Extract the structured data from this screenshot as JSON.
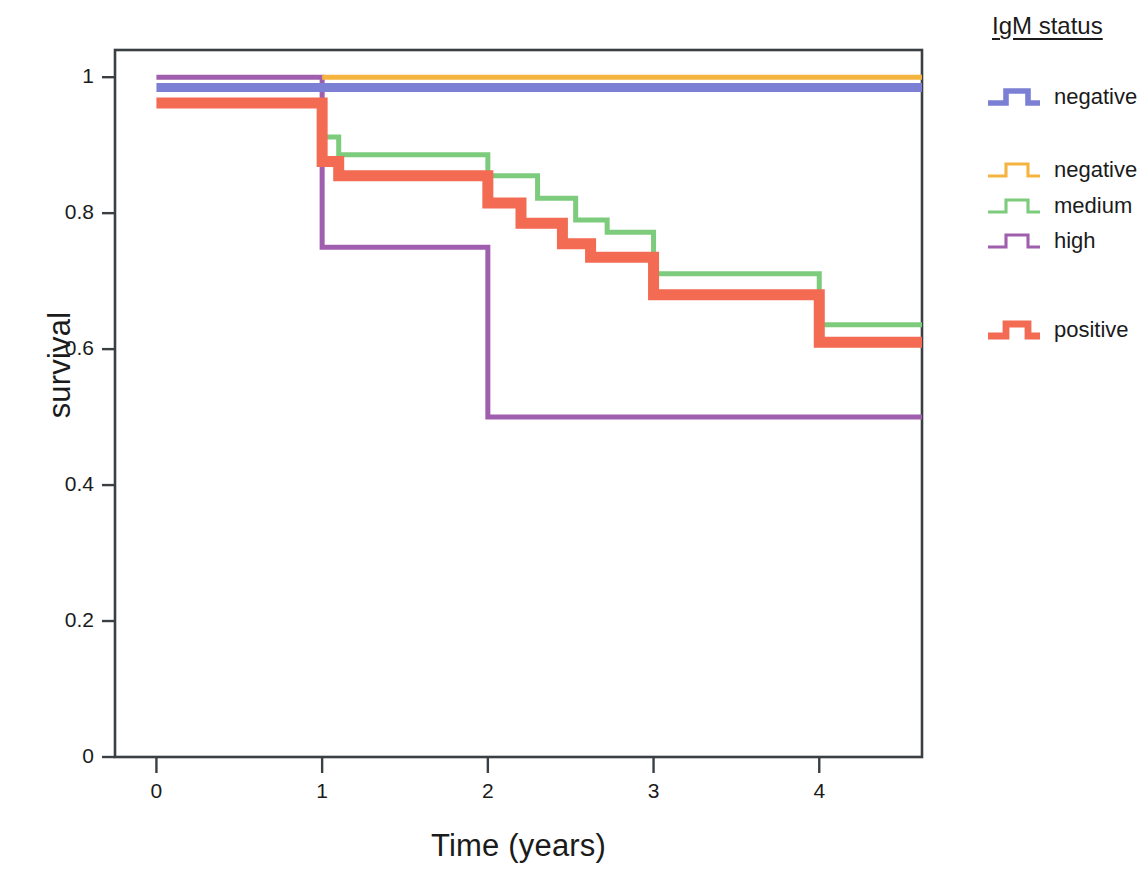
{
  "chart_data": {
    "type": "line",
    "subtype": "kaplan-meier-step",
    "title": "",
    "xlabel": "Time (years)",
    "ylabel": "survival",
    "xlim": [
      -0.25,
      4.62
    ],
    "ylim": [
      0,
      1.04
    ],
    "xticks": [
      0,
      1,
      2,
      3,
      4
    ],
    "xtick_labels": [
      "0",
      "1",
      "2",
      "3",
      "4"
    ],
    "yticks": [
      0,
      0.2,
      0.4,
      0.6,
      0.8,
      1
    ],
    "ytick_labels": [
      "0",
      "0.2",
      "0.4",
      "0.6",
      "0.8",
      "1"
    ],
    "grid": false,
    "legend_position": "right",
    "legend_title": "IgM status",
    "series": [
      {
        "name": "negative",
        "key": "negative_blue",
        "color": "#7b80d4",
        "width": 9,
        "x": [
          0,
          4.62
        ],
        "y": [
          0.985,
          0.985
        ],
        "steps": [
          [
            0,
            0.985
          ],
          [
            4.62,
            0.985
          ]
        ]
      },
      {
        "name": "negative",
        "key": "negative_orange",
        "color": "#f5b43f",
        "width": 5,
        "x": [
          1.0,
          4.62
        ],
        "y": [
          1.0,
          1.0
        ],
        "steps": [
          [
            1.0,
            1.0
          ],
          [
            4.62,
            1.0
          ]
        ]
      },
      {
        "name": "medium",
        "key": "medium_green",
        "color": "#7dcb7d",
        "width": 5,
        "steps": [
          [
            1.0,
            0.912
          ],
          [
            1.1,
            0.912
          ],
          [
            1.1,
            0.886
          ],
          [
            2.0,
            0.886
          ],
          [
            2.0,
            0.855
          ],
          [
            2.3,
            0.855
          ],
          [
            2.3,
            0.822
          ],
          [
            2.53,
            0.822
          ],
          [
            2.53,
            0.79
          ],
          [
            2.72,
            0.79
          ],
          [
            2.72,
            0.772
          ],
          [
            3.0,
            0.772
          ],
          [
            3.0,
            0.711
          ],
          [
            4.0,
            0.711
          ],
          [
            4.0,
            0.636
          ],
          [
            4.62,
            0.636
          ]
        ]
      },
      {
        "name": "high",
        "key": "high_purple",
        "color": "#a05fae",
        "width": 5,
        "steps": [
          [
            0,
            1.0
          ],
          [
            1.0,
            1.0
          ],
          [
            1.0,
            0.75
          ],
          [
            2.0,
            0.75
          ],
          [
            2.0,
            0.5
          ],
          [
            4.62,
            0.5
          ]
        ]
      },
      {
        "name": "positive",
        "key": "positive_red",
        "color": "#f26b52",
        "width": 11,
        "steps": [
          [
            0,
            0.962
          ],
          [
            1.0,
            0.962
          ],
          [
            1.0,
            0.876
          ],
          [
            1.1,
            0.876
          ],
          [
            1.1,
            0.855
          ],
          [
            2.0,
            0.855
          ],
          [
            2.0,
            0.815
          ],
          [
            2.2,
            0.815
          ],
          [
            2.2,
            0.785
          ],
          [
            2.45,
            0.785
          ],
          [
            2.45,
            0.755
          ],
          [
            2.62,
            0.755
          ],
          [
            2.62,
            0.735
          ],
          [
            3.0,
            0.735
          ],
          [
            3.0,
            0.68
          ],
          [
            4.0,
            0.68
          ],
          [
            4.0,
            0.61
          ],
          [
            4.62,
            0.61
          ]
        ]
      }
    ]
  },
  "legend": {
    "title": "IgM status",
    "entries": [
      {
        "label": "negative",
        "color": "#7b80d4",
        "width": 9,
        "top": 80
      },
      {
        "label": "negative",
        "color": "#f5b43f",
        "width": 5,
        "top": 153
      },
      {
        "label": "medium",
        "color": "#7dcb7d",
        "width": 5,
        "top": 189
      },
      {
        "label": "high",
        "color": "#a05fae",
        "width": 5,
        "top": 224
      },
      {
        "label": "positive",
        "color": "#f26b52",
        "width": 11,
        "top": 313
      }
    ]
  },
  "axes": {
    "x_title": "Time (years)",
    "y_title": "survival",
    "frame_color": "#3a3f44"
  }
}
